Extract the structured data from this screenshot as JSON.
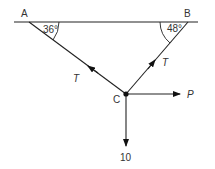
{
  "diagram": {
    "type": "force-diagram",
    "points": {
      "A": {
        "label": "A"
      },
      "B": {
        "label": "B"
      },
      "C": {
        "label": "C"
      }
    },
    "angles": {
      "at_A": "36°",
      "at_B": "48°"
    },
    "forces": {
      "tension_CA": "T",
      "tension_CB": "T",
      "horizontal": "P",
      "weight": "10"
    },
    "colors": {
      "line": "#222222",
      "text": "#333333"
    }
  }
}
